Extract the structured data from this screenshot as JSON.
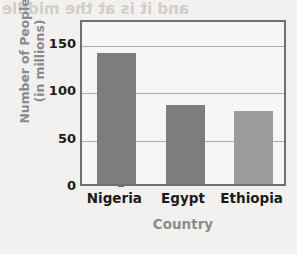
{
  "chart_data": {
    "type": "bar",
    "title": "",
    "categories": [
      "Nigeria",
      "Egypt",
      "Ethiopia"
    ],
    "values": [
      138,
      83,
      77
    ],
    "xlabel": "Country",
    "ylabel": "Number of People (in millions)",
    "ylabel_line1": "Number of People",
    "ylabel_line2": "(in millions)",
    "ylim": [
      0,
      175
    ],
    "yticks": [
      0,
      50,
      100,
      150
    ],
    "ytick_labels": [
      "0",
      "50",
      "100",
      "150"
    ],
    "grid": true,
    "legend": "none",
    "bar_colors": [
      "#7d7d7d",
      "#7d7d7d",
      "#9c9c9c"
    ],
    "plot_background": "#f7f6f4",
    "frame_color": "#6f6f6f",
    "gridline_color": "#a9a9a9",
    "axis_title_color": "#8b8b8b",
    "tick_label_color": "#1b1b1b"
  },
  "page": {
    "background": "#f2f1ef",
    "bleed_through": {
      "top": "and it is at the middle",
      "middle_line_1": "zonqmox",
      "middle_line_2": "nconqmgn"
    }
  }
}
